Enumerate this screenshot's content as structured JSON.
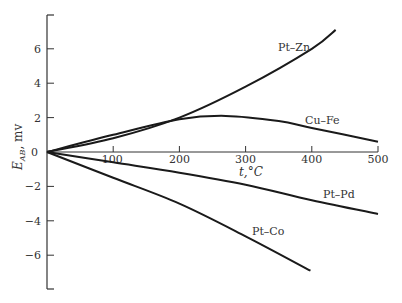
{
  "chart_data": {
    "type": "line",
    "title": "",
    "xlabel": "t, °C",
    "ylabel": "E_AB, mv",
    "xlim": [
      0,
      500
    ],
    "ylim": [
      -8,
      8
    ],
    "grid": false,
    "legend": "inline labels",
    "x_ticks": [
      100,
      200,
      300,
      400,
      500
    ],
    "y_ticks": [
      6,
      4,
      2,
      0,
      -2,
      -4,
      -6
    ],
    "y_tick_labels": [
      "6",
      "4",
      "2",
      "0",
      "−2",
      "−4",
      "−6"
    ],
    "x_tick_labels": [
      "100",
      "200",
      "300",
      "400",
      "500"
    ],
    "series": [
      {
        "name": "Pt–Zn",
        "x": [
          0,
          100,
          200,
          300,
          400,
          436
        ],
        "values": [
          0,
          0.8,
          2.0,
          3.8,
          6.0,
          7.1
        ]
      },
      {
        "name": "Cu–Fe",
        "x": [
          0,
          100,
          200,
          270,
          350,
          400,
          500
        ],
        "values": [
          0,
          1.0,
          1.9,
          2.1,
          1.8,
          1.4,
          0.6
        ]
      },
      {
        "name": "Pt–Pd",
        "x": [
          0,
          100,
          200,
          300,
          400,
          500
        ],
        "values": [
          0,
          -0.6,
          -1.2,
          -1.9,
          -2.8,
          -3.6
        ]
      },
      {
        "name": "Pt–Co",
        "x": [
          0,
          100,
          200,
          300,
          398
        ],
        "values": [
          0,
          -1.5,
          -3.0,
          -4.9,
          -6.9
        ]
      }
    ]
  },
  "labels": {
    "ylabel_main": "E",
    "ylabel_sub": "AB",
    "ylabel_unit": ", mv",
    "xlabel": "t,°C",
    "zero": "0"
  }
}
